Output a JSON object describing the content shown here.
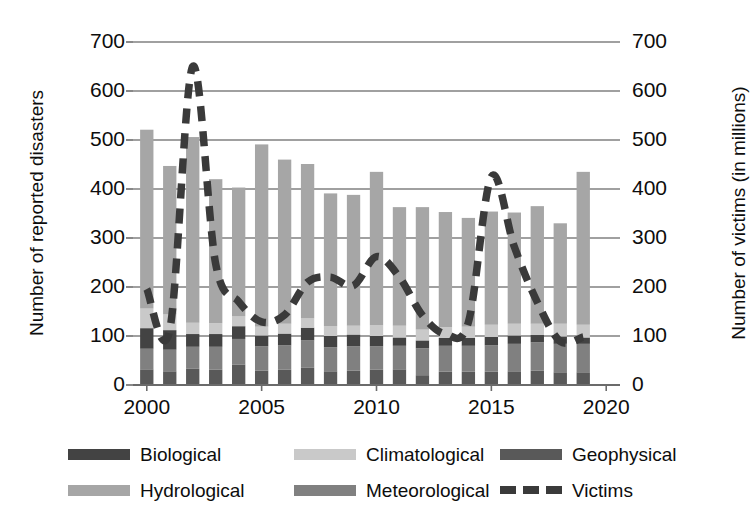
{
  "chart_data": {
    "type": "bar",
    "subtype": "stacked-bar-with-line",
    "title": "",
    "xlabel": "",
    "ylabel": "Number of reported disasters",
    "y2label": "Number of  victims (in millions)",
    "ylim": [
      0,
      700
    ],
    "y2lim": [
      0,
      700
    ],
    "yticks": [
      0,
      100,
      200,
      300,
      400,
      500,
      600,
      700
    ],
    "y2ticks": [
      0,
      100,
      200,
      300,
      400,
      500,
      600,
      700
    ],
    "xticks": [
      2000,
      2005,
      2010,
      2015,
      2020
    ],
    "xlim": [
      1999.4,
      2020.6
    ],
    "grid": true,
    "legend_position": "bottom",
    "categories": [
      2000,
      2001,
      2002,
      2003,
      2004,
      2005,
      2006,
      2007,
      2008,
      2009,
      2010,
      2011,
      2012,
      2013,
      2014,
      2015,
      2016,
      2017,
      2018,
      2019
    ],
    "series": [
      {
        "name": "Geophysical",
        "color": "#595959",
        "values": [
          32,
          28,
          33,
          31,
          42,
          29,
          31,
          35,
          28,
          29,
          31,
          32,
          20,
          27,
          27,
          27,
          28,
          29,
          26,
          26
        ]
      },
      {
        "name": "Meteorological",
        "color": "#808080",
        "values": [
          42,
          44,
          45,
          47,
          52,
          50,
          50,
          56,
          49,
          50,
          48,
          48,
          55,
          53,
          53,
          54,
          56,
          58,
          58,
          58
        ]
      },
      {
        "name": "Biological",
        "color": "#434343",
        "values": [
          42,
          40,
          26,
          26,
          26,
          22,
          24,
          26,
          23,
          24,
          21,
          17,
          16,
          16,
          16,
          17,
          17,
          15,
          15,
          13
        ]
      },
      {
        "name": "Climatological",
        "color": "#c9c9c9",
        "values": [
          40,
          32,
          23,
          22,
          20,
          18,
          20,
          19,
          20,
          18,
          22,
          24,
          22,
          22,
          23,
          25,
          24,
          23,
          26,
          26
        ]
      },
      {
        "name": "Hydrological",
        "color": "#a6a6a6",
        "values": [
          365,
          303,
          379,
          294,
          263,
          372,
          335,
          315,
          271,
          267,
          313,
          242,
          250,
          235,
          222,
          231,
          227,
          240,
          205,
          312
        ]
      }
    ],
    "series_totals": [
      521,
      447,
      506,
      420,
      403,
      491,
      460,
      451,
      391,
      388,
      435,
      363,
      363,
      353,
      341,
      354,
      352,
      365,
      330,
      435
    ],
    "line_series": {
      "name": "Victims",
      "color": "#3a3a3a",
      "style": "dashed",
      "values": [
        196,
        112,
        650,
        247,
        170,
        129,
        143,
        210,
        220,
        203,
        262,
        220,
        142,
        104,
        128,
        425,
        282,
        169,
        89,
        98
      ]
    }
  },
  "axes": {
    "left_title": "Number of reported disasters",
    "right_title": "Number of  victims (in millions)",
    "left_ticks": [
      "700",
      "600",
      "500",
      "400",
      "300",
      "200",
      "100",
      "0"
    ],
    "right_ticks": [
      "700",
      "600",
      "500",
      "400",
      "300",
      "200",
      "100",
      "0"
    ],
    "x_ticks": [
      "2000",
      "2005",
      "2010",
      "2015",
      "2020"
    ]
  },
  "legend": {
    "items": [
      {
        "label": "Biological",
        "color": "#434343",
        "kind": "swatch"
      },
      {
        "label": "Climatological",
        "color": "#c9c9c9",
        "kind": "swatch"
      },
      {
        "label": "Geophysical",
        "color": "#595959",
        "kind": "swatch"
      },
      {
        "label": "Hydrological",
        "color": "#a6a6a6",
        "kind": "swatch"
      },
      {
        "label": "Meteorological",
        "color": "#808080",
        "kind": "swatch"
      },
      {
        "label": "Victims",
        "color": "#3a3a3a",
        "kind": "dashed-line"
      }
    ]
  }
}
